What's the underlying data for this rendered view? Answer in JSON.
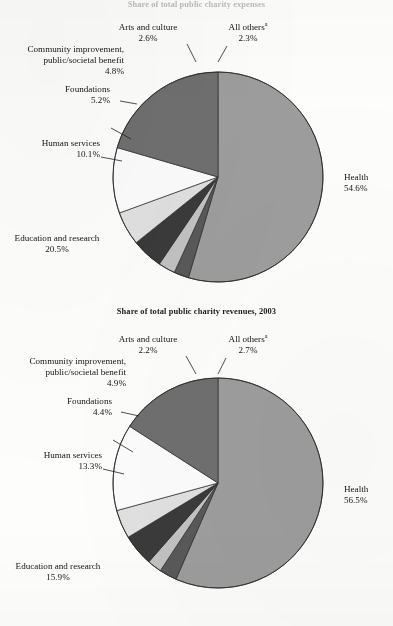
{
  "page": {
    "background_color": "#fdfdfc",
    "ink_color": "#141414"
  },
  "top": {
    "title": "Share of total public charity expenses",
    "labels": {
      "health": "Health",
      "health_pct": "54.6%",
      "education": "Education and research",
      "education_pct": "20.5%",
      "human_services": "Human services",
      "human_services_pct": "10.1%",
      "foundations": "Foundations",
      "foundations_pct": "5.2%",
      "community_line1": "Community improvement,",
      "community_line2": "public/societal benefit",
      "community_pct": "4.8%",
      "arts": "Arts and culture",
      "arts_pct": "2.6%",
      "all_others": "All others",
      "all_others_note": "a",
      "all_others_pct": "2.3%"
    }
  },
  "bottom": {
    "title": "Share of total public charity revenues, 2003",
    "labels": {
      "health": "Health",
      "health_pct": "56.5%",
      "education": "Education and research",
      "education_pct": "15.9%",
      "human_services": "Human services",
      "human_services_pct": "13.3%",
      "foundations": "Foundations",
      "foundations_pct": "4.4%",
      "community_line1": "Community improvement,",
      "community_line2": "public/societal benefit",
      "community_pct": "4.9%",
      "arts": "Arts and culture",
      "arts_pct": "2.2%",
      "all_others": "All others",
      "all_others_note": "a",
      "all_others_pct": "2.7%"
    }
  },
  "chart_data": [
    {
      "type": "pie",
      "title": "Share of total public charity expenses",
      "id": "expenses",
      "center": [
        218,
        177
      ],
      "radius": 105,
      "start_angle_deg": 0,
      "direction": "clockwise",
      "unit": "percent",
      "categories": [
        "Health",
        "All others",
        "Arts and culture",
        "Community improvement, public/societal benefit",
        "Foundations",
        "Human services",
        "Education and research"
      ],
      "values": [
        54.6,
        2.3,
        2.6,
        4.8,
        5.2,
        10.1,
        20.5
      ],
      "colors": [
        "#9d9d9d",
        "#595959",
        "#c2c2c2",
        "#3a3a3a",
        "#e0e0e0",
        "#fbfbfb",
        "#6f6f6f"
      ],
      "slices": [
        {
          "label": "Health",
          "value": 54.6,
          "color": "#9d9d9d",
          "display": "54.6%"
        },
        {
          "label": "All others",
          "value": 2.3,
          "color": "#595959",
          "display": "2.3%",
          "footnote": "a"
        },
        {
          "label": "Arts and culture",
          "value": 2.6,
          "color": "#c2c2c2",
          "display": "2.6%"
        },
        {
          "label": "Community improvement, public/societal benefit",
          "value": 4.8,
          "color": "#3a3a3a",
          "display": "4.8%"
        },
        {
          "label": "Foundations",
          "value": 5.2,
          "color": "#e0e0e0",
          "display": "5.2%"
        },
        {
          "label": "Human services",
          "value": 10.1,
          "color": "#fbfbfb",
          "display": "10.1%"
        },
        {
          "label": "Education and research",
          "value": 20.5,
          "color": "#6f6f6f",
          "display": "20.5%"
        }
      ]
    },
    {
      "type": "pie",
      "title": "Share of total public charity revenues, 2003",
      "id": "revenues",
      "center": [
        218,
        483
      ],
      "radius": 105,
      "start_angle_deg": 0,
      "direction": "clockwise",
      "unit": "percent",
      "categories": [
        "Health",
        "All others",
        "Arts and culture",
        "Community improvement, public/societal benefit",
        "Foundations",
        "Human services",
        "Education and research"
      ],
      "values": [
        56.5,
        2.7,
        2.2,
        4.9,
        4.4,
        13.3,
        15.9
      ],
      "colors": [
        "#9d9d9d",
        "#595959",
        "#c2c2c2",
        "#3a3a3a",
        "#e0e0e0",
        "#fbfbfb",
        "#6f6f6f"
      ],
      "slices": [
        {
          "label": "Health",
          "value": 56.5,
          "color": "#9d9d9d",
          "display": "56.5%"
        },
        {
          "label": "All others",
          "value": 2.7,
          "color": "#595959",
          "display": "2.7%",
          "footnote": "a"
        },
        {
          "label": "Arts and culture",
          "value": 2.2,
          "color": "#c2c2c2",
          "display": "2.2%"
        },
        {
          "label": "Community improvement, public/societal benefit",
          "value": 4.9,
          "color": "#3a3a3a",
          "display": "4.9%"
        },
        {
          "label": "Foundations",
          "value": 4.4,
          "color": "#e0e0e0",
          "display": "4.4%"
        },
        {
          "label": "Human services",
          "value": 13.3,
          "color": "#fbfbfb",
          "display": "13.3%"
        },
        {
          "label": "Education and research",
          "value": 15.9,
          "color": "#6f6f6f",
          "display": "15.9%"
        }
      ]
    }
  ]
}
